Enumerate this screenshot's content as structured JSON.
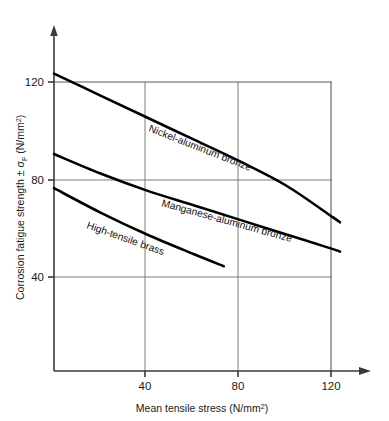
{
  "chart_data": {
    "type": "line",
    "title": "",
    "xlabel": "Mean tensile stress (N/mm2)",
    "ylabel": "Corrosion fatigue strength ± σF (N/mm2)",
    "xlim": [
      0,
      132
    ],
    "ylim": [
      0,
      135
    ],
    "xticks": [
      40,
      80,
      120
    ],
    "yticks": [
      40,
      80,
      120
    ],
    "grid": true,
    "legend": "inline-curve-labels",
    "series": [
      {
        "name": "Nickel-aluminum bronze",
        "label": "Nickel-aluminum bronze",
        "x": [
          0,
          20,
          40,
          60,
          80,
          100,
          120,
          123
        ],
        "y": [
          122,
          113,
          104,
          95,
          86,
          76,
          63,
          61
        ]
      },
      {
        "name": "Manganese-aluminum bronze",
        "label": "Manganese-aluminum bronze",
        "x": [
          0,
          20,
          40,
          60,
          80,
          100,
          120,
          123
        ],
        "y": [
          89,
          81,
          74,
          68,
          62,
          56,
          50,
          49
        ]
      },
      {
        "name": "High-tensile brass",
        "label": "High-tensile brass",
        "x": [
          0,
          20,
          40,
          60,
          73
        ],
        "y": [
          75,
          65,
          56,
          48,
          43
        ]
      }
    ]
  },
  "axes": {
    "y": {
      "title_main": "Corrosion fatigue strength ± σ",
      "title_sub": "F",
      "title_unit": " (N/mm",
      "title_unit_sup": "2",
      "title_unit_close": ")",
      "ticks": [
        "120",
        "80",
        "40"
      ]
    },
    "x": {
      "title_main": "Mean tensile stress (N/mm",
      "title_sup": "2",
      "title_close": ")",
      "ticks": [
        "40",
        "80",
        "120"
      ]
    }
  },
  "curve_labels": [
    {
      "text": "Nickel-aluminum bronze"
    },
    {
      "text": "Manganese-aluminum bronze"
    },
    {
      "text": "High-tensile brass"
    }
  ],
  "colors": {
    "background": "#ffffff",
    "curve": "#000000",
    "axis": "#3a3a3a",
    "grid": "#6e6e6e",
    "text": "#1a1a1a"
  }
}
